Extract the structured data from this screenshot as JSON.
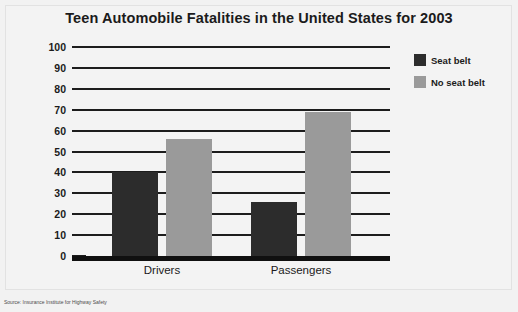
{
  "source_note": "Source: Insurance Institute for Highway Safety",
  "colors": {
    "seat_belt": "#2c2c2c",
    "no_seat_belt": "#9a9a9a",
    "axis": "#1c1c1c",
    "background": "#f3f3f3"
  },
  "chart_data": {
    "type": "bar",
    "title": "Teen Automobile Fatalities in the United States for 2003",
    "xlabel": "",
    "ylabel": "Percentage of accidents",
    "categories": [
      "Drivers",
      "Passengers"
    ],
    "ylim": [
      0,
      100
    ],
    "yticks": [
      0,
      10,
      20,
      30,
      40,
      50,
      60,
      70,
      80,
      90,
      100
    ],
    "ytick_labels": [
      "0",
      "10",
      "20",
      "30",
      "40",
      "50",
      "60",
      "70",
      "80",
      "90",
      "100"
    ],
    "grid": true,
    "legend_position": "top-right",
    "series": [
      {
        "name": "Seat belt",
        "values": [
          41,
          27
        ]
      },
      {
        "name": "No seat belt",
        "values": [
          57,
          70
        ]
      }
    ]
  }
}
